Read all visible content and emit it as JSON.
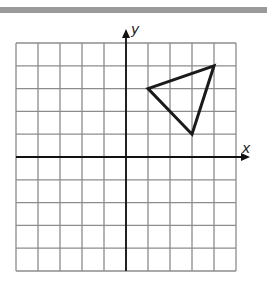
{
  "graph": {
    "x_axis_label": "x",
    "y_axis_label": "y",
    "x_range": [
      -5,
      5
    ],
    "y_range": [
      -5,
      5
    ],
    "grid_step": 1,
    "grid_color": "#8c8c8c",
    "axis_color": "#111111",
    "triangle": {
      "vertices": [
        [
          1,
          3
        ],
        [
          4,
          4
        ],
        [
          3,
          1
        ]
      ],
      "stroke": "#1a1a1a"
    }
  }
}
